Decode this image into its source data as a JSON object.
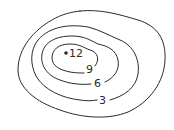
{
  "map": {
    "type": "contour map",
    "line_color": "#2a2a2a",
    "background": "#ffffff",
    "peak": {
      "label": "12",
      "marker": "dot"
    },
    "contours": [
      {
        "level": "outer",
        "label": ""
      },
      {
        "level": 3,
        "label": "3"
      },
      {
        "level": 6,
        "label": "6"
      },
      {
        "level": 9,
        "label": "9"
      }
    ]
  }
}
